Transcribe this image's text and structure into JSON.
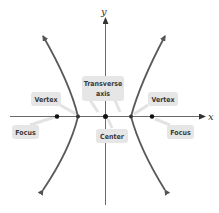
{
  "diagram": {
    "axes": {
      "x_label": "x",
      "y_label": "y"
    },
    "labels": {
      "vertex_left": "Vertex",
      "vertex_right": "Vertex",
      "focus_left": "Focus",
      "focus_right": "Focus",
      "transverse_axis_line1": "Transverse",
      "transverse_axis_line2": "axis",
      "center": "Center"
    },
    "colors": {
      "curve": "#5a5a5a",
      "axis": "#444444",
      "label_box": "#e6e6e6",
      "label_text": "#3a3a3a",
      "point": "#111111"
    }
  }
}
